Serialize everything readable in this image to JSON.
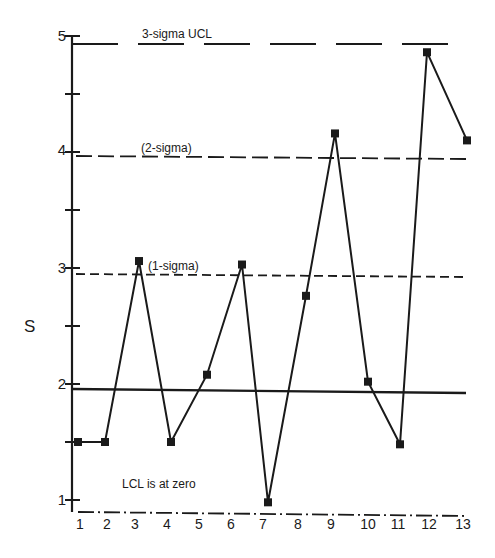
{
  "chart_data": {
    "type": "line",
    "title": "",
    "xlabel": "",
    "ylabel": "S",
    "x": [
      1,
      2,
      3,
      4,
      5,
      6,
      7,
      8,
      9,
      10,
      11,
      12,
      13
    ],
    "categories": [
      "1",
      "2",
      "3",
      "4",
      "5",
      "6",
      "7",
      "8",
      "9",
      "10",
      "11",
      "12",
      "13"
    ],
    "series": [
      {
        "name": "S",
        "values": [
          1.5,
          1.5,
          3.06,
          1.5,
          2.08,
          3.03,
          0.98,
          2.76,
          4.16,
          2.02,
          1.48,
          4.86,
          4.1
        ]
      }
    ],
    "reference_lines": [
      {
        "name": "3-sigma UCL",
        "label": "3-sigma UCL",
        "value": 4.93,
        "style": "long-dash"
      },
      {
        "name": "2-sigma",
        "label": "(2-sigma)",
        "value": 3.95,
        "style": "dash"
      },
      {
        "name": "1-sigma",
        "label": "(1-sigma)",
        "value": 2.95,
        "style": "short-dash"
      },
      {
        "name": "center line",
        "label": "",
        "value": 1.95,
        "style": "solid"
      },
      {
        "name": "LCL",
        "label": "LCL is at zero",
        "value": 0,
        "style": "dash-dot"
      }
    ],
    "y_ticks": [
      1,
      2,
      3,
      4,
      5
    ],
    "y_minor_ticks": [
      1.5,
      2.5,
      3.5,
      4.5
    ],
    "ylim": [
      0.9,
      5.0
    ],
    "xlim": [
      0.5,
      13.5
    ],
    "grid": false,
    "legend": "none",
    "annotations": [
      "3-sigma UCL",
      "(2-sigma)",
      "(1-sigma)",
      "LCL is at zero"
    ]
  },
  "labels": {
    "ylabel": "S",
    "ucl": "3-sigma UCL",
    "two_sigma": "(2-sigma)",
    "one_sigma": "(1-sigma)",
    "lcl_note": "LCL is at zero",
    "y_ticks": [
      "1",
      "2",
      "3",
      "4",
      "5"
    ],
    "x_ticks": [
      "1",
      "2",
      "3",
      "4",
      "5",
      "6",
      "7",
      "8",
      "9",
      "10",
      "11",
      "12",
      "13"
    ]
  },
  "colors": {
    "ink": "#1a1a1a",
    "background": "#ffffff"
  }
}
